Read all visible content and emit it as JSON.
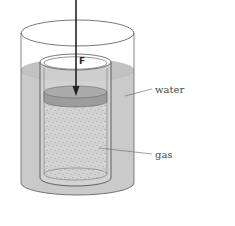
{
  "diagram": {
    "title": "",
    "labels": {
      "force": "F",
      "water": "water",
      "gas": "gas"
    },
    "components": [
      {
        "name": "outer-cylinder",
        "description": "open transparent container"
      },
      {
        "name": "water",
        "description": "water filling outer container"
      },
      {
        "name": "inner-cylinder",
        "description": "gas cylinder immersed in water"
      },
      {
        "name": "piston",
        "description": "movable piston pressed down by force F"
      },
      {
        "name": "gas",
        "description": "gas trapped below piston, shown speckled"
      },
      {
        "name": "force-arrow",
        "description": "downward arrow applying force F on piston"
      }
    ],
    "colors": {
      "water": "#c8c8c8",
      "water_surface": "#bdbdbd",
      "piston_top": "#a9a9a9",
      "piston_side": "#9a9a9a",
      "gas": "#d6d6d6",
      "gas_dots": "#8a8a8a",
      "outline": "#555555",
      "arrow": "#222222"
    }
  }
}
